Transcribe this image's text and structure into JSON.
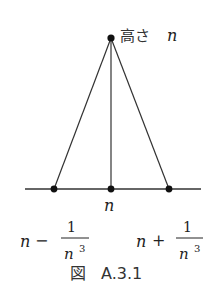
{
  "diagram": {
    "apex_label": {
      "prefix": "高さ",
      "var": "n"
    },
    "center_label": "n",
    "left_label": {
      "var": "n",
      "op": "−",
      "numerator": "1",
      "denominator_var": "n",
      "denominator_exp": "3"
    },
    "right_label": {
      "var": "n",
      "op": "+",
      "numerator": "1",
      "denominator_var": "n",
      "denominator_exp": "3"
    },
    "caption": {
      "prefix": "図",
      "number": "A.3.1"
    },
    "colors": {
      "line": "#333333",
      "dot": "#111111",
      "text": "#222222"
    }
  }
}
